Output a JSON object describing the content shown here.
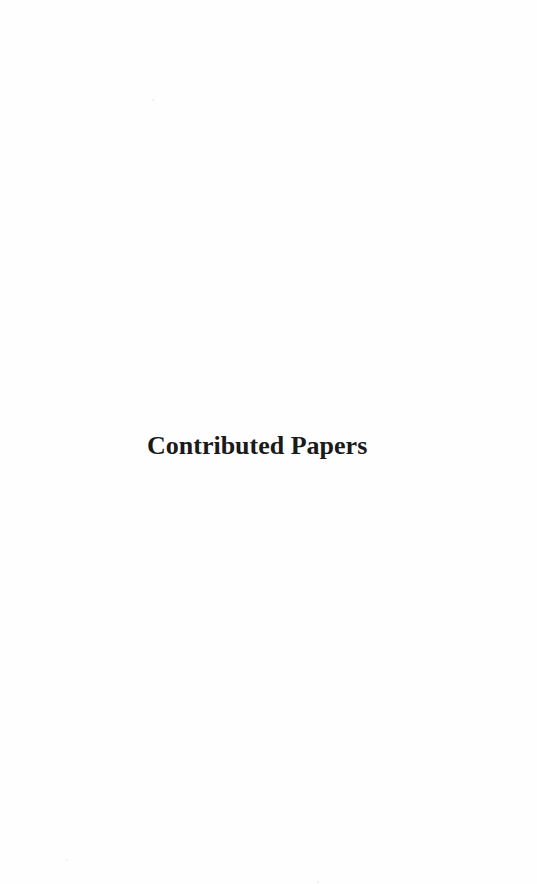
{
  "page": {
    "title": "Contributed Papers",
    "text_color": "#1a1a1a",
    "background_color": "#fefefe"
  }
}
